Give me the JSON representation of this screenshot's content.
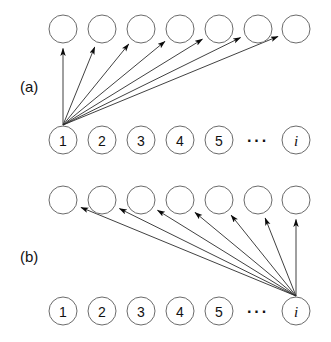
{
  "figure": {
    "type": "diagram",
    "title": "",
    "background_color": "#ffffff",
    "node_stroke_color": "#6b6b6b",
    "edge_color": "#2b2b2b",
    "text_color": "#111111",
    "geometry": {
      "node_radius": 14,
      "column_centers_x": [
        63,
        102,
        141,
        180,
        219,
        258,
        296
      ],
      "panel_a_top_row_y": 29,
      "panel_a_bottom_row_y": 140,
      "panel_b_top_row_y": 200,
      "panel_b_bottom_row_y": 311
    },
    "panels": [
      {
        "id": "a",
        "label": "(a)",
        "source_index": 0,
        "source_label": "1",
        "description": "All arrows originate at node 1 and fan rightward to every node in the upper row",
        "top_row": [
          {
            "label": "",
            "index": 0
          },
          {
            "label": "",
            "index": 1
          },
          {
            "label": "",
            "index": 2
          },
          {
            "label": "",
            "index": 3
          },
          {
            "label": "",
            "index": 4
          },
          {
            "label": "",
            "index": 5
          },
          {
            "label": "",
            "index": 6
          }
        ],
        "bottom_row": [
          {
            "label": "1",
            "kind": "number"
          },
          {
            "label": "2",
            "kind": "number"
          },
          {
            "label": "3",
            "kind": "number"
          },
          {
            "label": "4",
            "kind": "number"
          },
          {
            "label": "5",
            "kind": "number"
          },
          {
            "label": "···",
            "kind": "ellipsis"
          },
          {
            "label": "i",
            "kind": "italic"
          }
        ],
        "edges": [
          {
            "from": "1",
            "to_column": 0
          },
          {
            "from": "1",
            "to_column": 1
          },
          {
            "from": "1",
            "to_column": 2
          },
          {
            "from": "1",
            "to_column": 3
          },
          {
            "from": "1",
            "to_column": 4
          },
          {
            "from": "1",
            "to_column": 5
          },
          {
            "from": "1",
            "to_column": 6
          }
        ]
      },
      {
        "id": "b",
        "label": "(b)",
        "source_index": 6,
        "source_label": "i",
        "description": "All arrows originate at node i and fan leftward to every node in the upper row",
        "top_row": [
          {
            "label": "",
            "index": 0
          },
          {
            "label": "",
            "index": 1
          },
          {
            "label": "",
            "index": 2
          },
          {
            "label": "",
            "index": 3
          },
          {
            "label": "",
            "index": 4
          },
          {
            "label": "",
            "index": 5
          },
          {
            "label": "",
            "index": 6
          }
        ],
        "bottom_row": [
          {
            "label": "1",
            "kind": "number"
          },
          {
            "label": "2",
            "kind": "number"
          },
          {
            "label": "3",
            "kind": "number"
          },
          {
            "label": "4",
            "kind": "number"
          },
          {
            "label": "5",
            "kind": "number"
          },
          {
            "label": "···",
            "kind": "ellipsis"
          },
          {
            "label": "i",
            "kind": "italic"
          }
        ],
        "edges": [
          {
            "from": "i",
            "to_column": 0
          },
          {
            "from": "i",
            "to_column": 1
          },
          {
            "from": "i",
            "to_column": 2
          },
          {
            "from": "i",
            "to_column": 3
          },
          {
            "from": "i",
            "to_column": 4
          },
          {
            "from": "i",
            "to_column": 5
          },
          {
            "from": "i",
            "to_column": 6
          }
        ]
      }
    ]
  }
}
